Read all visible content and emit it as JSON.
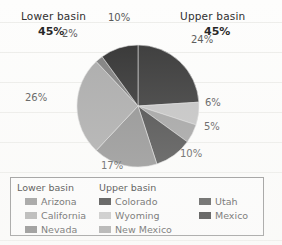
{
  "headings": {
    "lower": {
      "label": "Lower basin",
      "pct": "45%"
    },
    "upper": {
      "label": "Upper basin",
      "pct": "45%"
    }
  },
  "slice_labels": {
    "colorado": "24%",
    "wyoming": "6%",
    "new_mexico": "5%",
    "utah": "10%",
    "arizona": "17%",
    "california": "26%",
    "nevada": "2%",
    "mexico": "10%"
  },
  "legend": {
    "lower_title": "Lower basin",
    "upper_title": "Upper basin",
    "lower_items": [
      {
        "label": "Arizona",
        "color": "#8f8f8f"
      },
      {
        "label": "California",
        "color": "#a9a9a9"
      },
      {
        "label": "Nevada",
        "color": "#7d7d7d"
      }
    ],
    "upper_items": [
      {
        "label": "Colorado",
        "color": "#343434"
      },
      {
        "label": "Wyoming",
        "color": "#c2c2c2"
      },
      {
        "label": "New Mexico",
        "color": "#a0a0a0"
      }
    ],
    "right_items": [
      {
        "label": "Utah",
        "color": "#474747"
      },
      {
        "label": "Mexico",
        "color": "#2e2e2e"
      }
    ]
  },
  "chart_data": {
    "type": "pie",
    "title": "",
    "legend_position": "bottom",
    "grid": false,
    "units": "percent",
    "groups": [
      {
        "name": "Lower basin",
        "total": 45
      },
      {
        "name": "Upper basin",
        "total": 45
      }
    ],
    "start_angle_deg": 0,
    "direction": "clockwise",
    "categories": [
      "Colorado",
      "Wyoming",
      "New Mexico",
      "Utah",
      "Arizona",
      "California",
      "Nevada",
      "Mexico"
    ],
    "values": [
      24,
      6,
      5,
      10,
      17,
      26,
      2,
      10
    ],
    "labels": [
      "24%",
      "6%",
      "5%",
      "10%",
      "17%",
      "26%",
      "2%",
      "10%"
    ],
    "colors": [
      "#343434",
      "#c2c2c2",
      "#a0a0a0",
      "#474747",
      "#8f8f8f",
      "#a9a9a9",
      "#7d7d7d",
      "#2e2e2e"
    ],
    "slices": [
      {
        "name": "Colorado",
        "value": 24,
        "color": "#343434",
        "group": "Upper basin"
      },
      {
        "name": "Wyoming",
        "value": 6,
        "color": "#c2c2c2",
        "group": "Upper basin"
      },
      {
        "name": "New Mexico",
        "value": 5,
        "color": "#a0a0a0",
        "group": "Upper basin"
      },
      {
        "name": "Utah",
        "value": 10,
        "color": "#474747",
        "group": "Upper basin"
      },
      {
        "name": "Arizona",
        "value": 17,
        "color": "#8f8f8f",
        "group": "Lower basin"
      },
      {
        "name": "California",
        "value": 26,
        "color": "#a9a9a9",
        "group": "Lower basin"
      },
      {
        "name": "Nevada",
        "value": 2,
        "color": "#7d7d7d",
        "group": "Lower basin"
      },
      {
        "name": "Mexico",
        "value": 10,
        "color": "#2e2e2e",
        "group": "Mexico"
      }
    ]
  }
}
